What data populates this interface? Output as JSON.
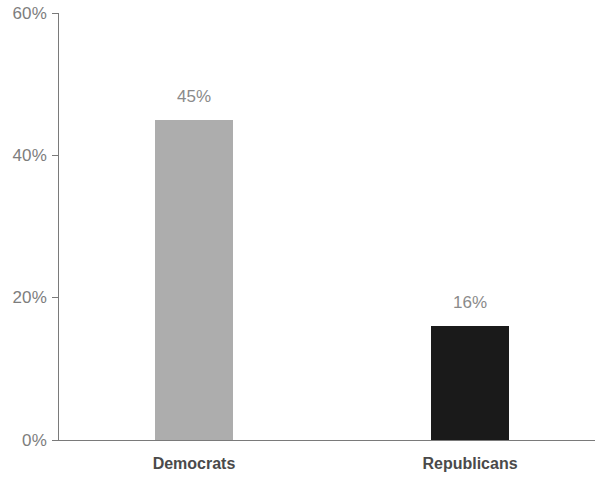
{
  "chart_data": {
    "type": "bar",
    "title": "",
    "subtitle": "",
    "xlabel": "",
    "ylabel": "",
    "categories": [
      "Democrats",
      "Republicans"
    ],
    "values": [
      45,
      16
    ],
    "value_labels": [
      "45%",
      "16%"
    ],
    "bar_colors": [
      "#adadad",
      "#1a1a1a"
    ],
    "ylim": [
      0,
      60
    ],
    "y_ticks": [
      0,
      20,
      40,
      60
    ],
    "y_tick_labels": [
      "0%",
      "20%",
      "40%",
      "60%"
    ],
    "grid": false,
    "legend": null,
    "legend_position": "none",
    "axis_color": "#7a7a7a",
    "tick_label_color": "#7d7d7d",
    "value_label_color": "#8a8a8a",
    "category_label_color": "#4a4a4a",
    "background_color": "#ffffff"
  },
  "axis": {
    "ticks": [
      {
        "label": "60%",
        "value": 60
      },
      {
        "label": "40%",
        "value": 40
      },
      {
        "label": "20%",
        "value": 20
      },
      {
        "label": "0%",
        "value": 0
      }
    ]
  },
  "bars": [
    {
      "category": "Democrats",
      "value": 45,
      "value_label": "45%",
      "color": "#adadad"
    },
    {
      "category": "Republicans",
      "value": 16,
      "value_label": "16%",
      "color": "#1a1a1a"
    }
  ]
}
